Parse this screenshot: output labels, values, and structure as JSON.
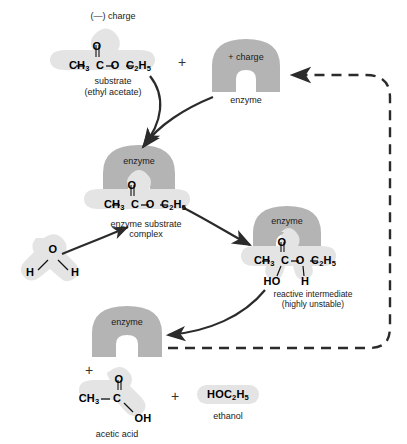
{
  "figure": {
    "title_absent": true,
    "background": "#ffffff",
    "colors": {
      "enzyme_fill": "#b4b4b4",
      "molecule_halo": "#e2e2e2",
      "arrow": "#2b2b2b",
      "text": "#1a1a1a"
    }
  },
  "labels": {
    "negative_charge": "(—) charge",
    "positive_charge": "+ charge",
    "enzyme": "enzyme",
    "substrate_name": "substrate",
    "substrate_sub": "(ethyl acetate)",
    "complex_line1": "enzyme substrate",
    "complex_line2": "complex",
    "intermediate_line1": "reactive intermediate",
    "intermediate_line2": "(highly unstable)",
    "acetic_acid": "acetic acid",
    "ethanol": "ethanol",
    "plus": "+"
  },
  "molecules": {
    "substrate": {
      "top_atom": "O",
      "chain": [
        "CH",
        "C",
        "O",
        "C",
        "H"
      ],
      "formula_display": "CH3—C—O—C2H5"
    },
    "water": {
      "oxygen": "O",
      "hydrogen_left": "H",
      "hydrogen_right": "H"
    },
    "complex_substrate": {
      "top_atom": "O",
      "formula_display": "CH3—C—O—C2H5"
    },
    "intermediate": {
      "top_atom": "O",
      "formula_display": "CH3—C—O—C2H5",
      "lower_left": "HO",
      "lower_right": "H"
    },
    "acetic_acid": {
      "top_atom": "O",
      "left_group": "CH3",
      "center_atom": "C",
      "hydroxyl": "OH"
    },
    "ethanol": {
      "formula_display": "HOC2H5"
    }
  },
  "flow": {
    "steps": [
      "substrate binds enzyme",
      "enzyme substrate complex forms",
      "water attacks forming reactive intermediate",
      "intermediate breaks down releasing products",
      "enzyme is recycled"
    ],
    "recycle_arrow_style": "dashed"
  }
}
